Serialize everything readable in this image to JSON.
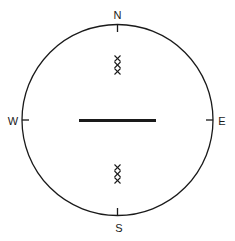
{
  "diagram": {
    "type": "compass-rose",
    "labels": {
      "north": "N",
      "south": "S",
      "east": "E",
      "west": "W"
    },
    "center_bar": {
      "orientation": "east-west"
    },
    "markers": {
      "north_group": {
        "symbol": "×",
        "count": 3
      },
      "south_group": {
        "symbol": "×",
        "count": 3
      }
    },
    "colors": {
      "stroke": "#1a1a1a",
      "background": "#ffffff"
    }
  }
}
